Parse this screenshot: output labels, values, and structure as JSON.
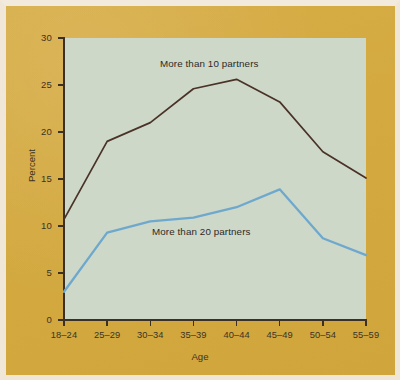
{
  "figure": {
    "background_color": "#d3a940",
    "panel_color": "#cbd6c6",
    "axis_color": "#3a3026"
  },
  "chart_data": {
    "type": "line",
    "title": "",
    "xlabel": "Age",
    "ylabel": "Percent",
    "categories": [
      "18–24",
      "25–29",
      "30–34",
      "35–39",
      "40–44",
      "45–49",
      "50–54",
      "55–59"
    ],
    "ylim": [
      0,
      30
    ],
    "yticks": [
      0,
      5,
      10,
      15,
      20,
      25,
      30
    ],
    "ytick_labels": [
      "0",
      "5",
      "10",
      "15",
      "20",
      "25",
      "30"
    ],
    "grid": false,
    "legend_position": "inline-annotations",
    "series": [
      {
        "name": "More than 10 partners",
        "color": "#4a3226",
        "values": [
          10.7,
          19.0,
          21.0,
          24.6,
          25.6,
          23.2,
          17.9,
          15.1
        ]
      },
      {
        "name": "More than 20 partners",
        "color": "#6fa8cd",
        "values": [
          3.0,
          9.3,
          10.5,
          10.9,
          12.0,
          13.9,
          8.7,
          6.9
        ]
      }
    ],
    "annotations": [
      {
        "text": "More than 10 partners",
        "x": 160,
        "y": 58
      },
      {
        "text": "More than 20 partners",
        "x": 152,
        "y": 226
      }
    ]
  }
}
